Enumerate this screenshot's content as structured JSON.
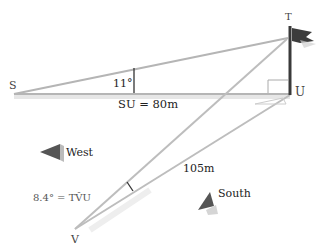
{
  "diagram": {
    "points": {
      "S": {
        "label": "S"
      },
      "T": {
        "label": "T"
      },
      "U": {
        "label": "U"
      },
      "V": {
        "label": "V"
      }
    },
    "angle_SU": "11°",
    "distance_SU": "SU = 80m",
    "angle_V": "8.4° = TV̂U",
    "distance_VU": "105m",
    "direction_west": "West",
    "direction_south": "South",
    "colors": {
      "line": "#b8b8b8",
      "pole": "#444444",
      "arrow": "#555555",
      "text": "#333333"
    }
  }
}
